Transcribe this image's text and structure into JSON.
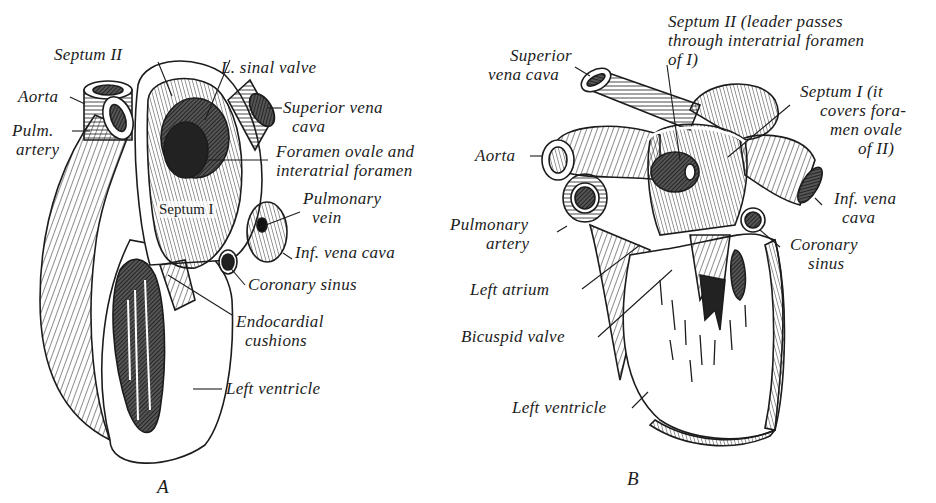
{
  "figure": {
    "panels": [
      {
        "id": "A",
        "letter": "A",
        "labels": {
          "septum_ii": "Septum II",
          "l_sinal_valve": "L. sinal valve",
          "aorta": "Aorta",
          "pulm_artery_1": "Pulm.",
          "pulm_artery_2": "artery",
          "superior_vena_cava_1": "Superior vena",
          "superior_vena_cava_2": "cava",
          "foramen_1": "Foramen ovale and",
          "foramen_2": "interatrial foramen",
          "septum_i": "Septum I",
          "pulmonary_vein_1": "Pulmonary",
          "pulmonary_vein_2": "vein",
          "inf_vena_cava": "Inf. vena cava",
          "coronary_sinus": "Coronary sinus",
          "endocardial_1": "Endocardial",
          "endocardial_2": "cushions",
          "left_ventricle": "Left ventricle"
        }
      },
      {
        "id": "B",
        "letter": "B",
        "labels": {
          "septum_ii_1": "Septum II (leader passes",
          "septum_ii_2": "through interatrial foramen",
          "septum_ii_3": "of I)",
          "superior_vena_cava_1": "Superior",
          "superior_vena_cava_2": "vena cava",
          "septum_i_1": "Septum I (it",
          "septum_i_2": "covers fora-",
          "septum_i_3": "men ovale",
          "septum_i_4": "of II)",
          "aorta": "Aorta",
          "inf_vena_cava_1": "Inf. vena",
          "inf_vena_cava_2": "cava",
          "pulmonary_artery_1": "Pulmonary",
          "pulmonary_artery_2": "artery",
          "coronary_sinus_1": "Coronary",
          "coronary_sinus_2": "sinus",
          "left_atrium": "Left atrium",
          "bicuspid_valve": "Bicuspid valve",
          "left_ventricle": "Left ventricle"
        }
      }
    ],
    "colors": {
      "ink": "#1c1c1c",
      "background": "#ffffff",
      "shade": "#555555"
    }
  }
}
